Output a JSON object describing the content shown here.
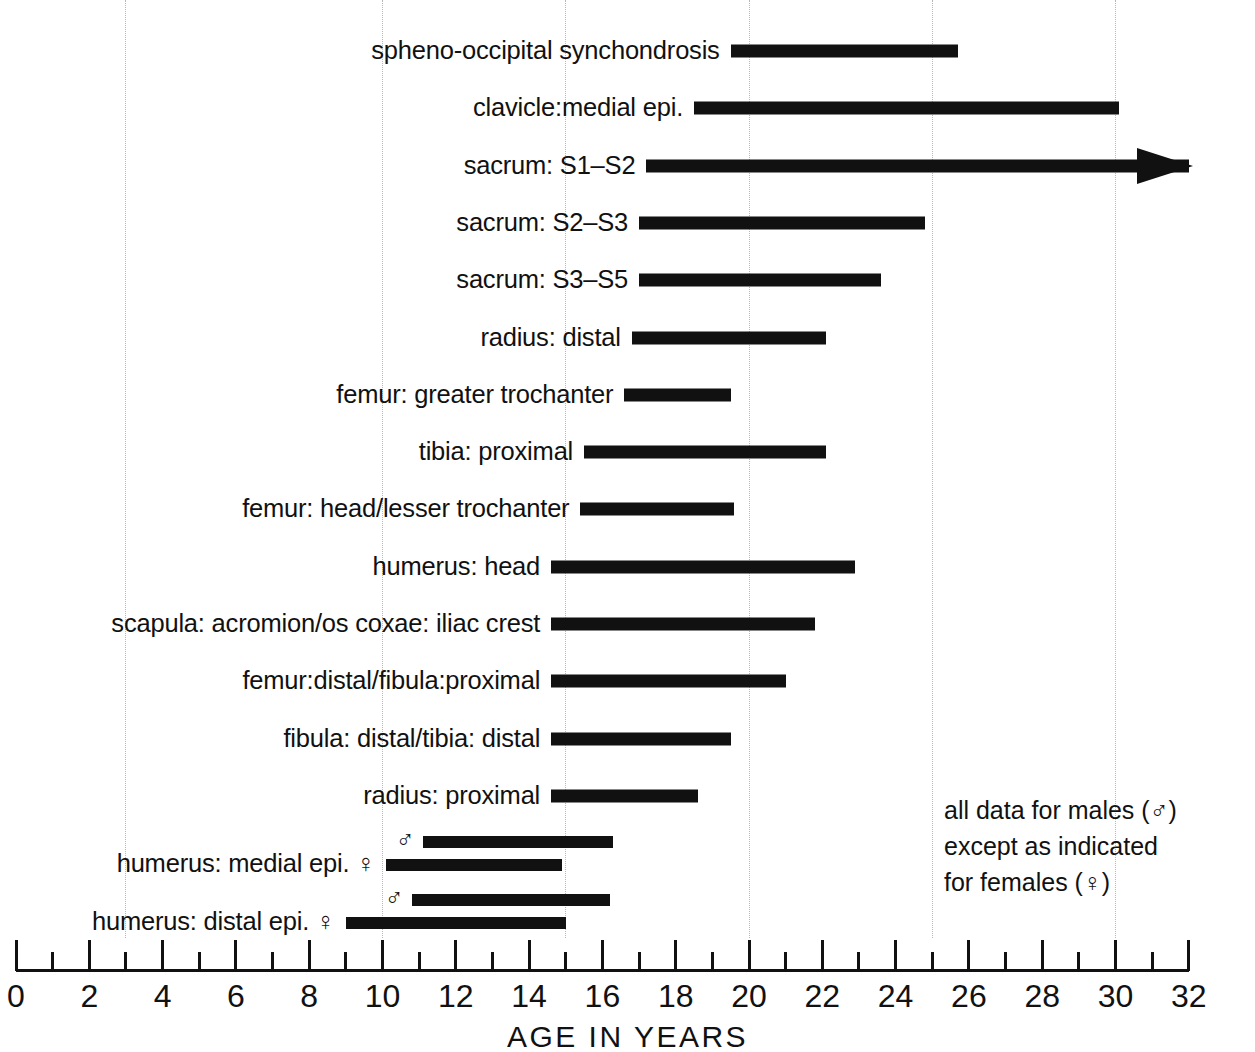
{
  "chart_data": {
    "type": "bar",
    "subtype": "horizontal-range-bars",
    "title": "",
    "xlabel": "AGE IN YEARS",
    "ylabel": "",
    "xlim": [
      0,
      32
    ],
    "xticks": [
      0,
      2,
      4,
      6,
      8,
      10,
      12,
      14,
      16,
      18,
      20,
      22,
      24,
      26,
      28,
      30,
      32
    ],
    "xtick_labels": [
      "0",
      "2",
      "4",
      "6",
      "8",
      "10",
      "12",
      "14",
      "16",
      "18",
      "20",
      "22",
      "24",
      "26",
      "28",
      "30",
      "32"
    ],
    "minor_tick_interval": 1,
    "gridlines": [
      3,
      10,
      15,
      20,
      25,
      30
    ],
    "grid": true,
    "legend": null,
    "bar_color": "#111111",
    "annotation_lines": [
      "all data for males (♂)",
      "except as indicated",
      "for females (♀)"
    ],
    "categories": [
      "spheno-occipital synchondrosis",
      "clavicle:medial epi.",
      "sacrum: S1–S2",
      "sacrum: S2–S3",
      "sacrum: S3–S5",
      "radius: distal",
      "femur: greater trochanter",
      "tibia: proximal",
      "femur: head/lesser trochanter",
      "humerus: head",
      "scapula: acromion/os coxae: iliac crest",
      "femur:distal/fibula:proximal",
      "fibula: distal/tibia: distal",
      "radius: proximal",
      "humerus: medial epi.",
      "humerus: distal epi."
    ],
    "rows": [
      {
        "label": "spheno-occipital synchondrosis",
        "bars": [
          {
            "sex": "male",
            "start": 19.5,
            "end": 25.7,
            "open_ended": false
          }
        ]
      },
      {
        "label": "clavicle:medial epi.",
        "bars": [
          {
            "sex": "male",
            "start": 18.5,
            "end": 30.1,
            "open_ended": false
          }
        ]
      },
      {
        "label": "sacrum: S1–S2",
        "bars": [
          {
            "sex": "male",
            "start": 17.2,
            "end": 32.0,
            "open_ended": true
          }
        ]
      },
      {
        "label": "sacrum: S2–S3",
        "bars": [
          {
            "sex": "male",
            "start": 17.0,
            "end": 24.8,
            "open_ended": false
          }
        ]
      },
      {
        "label": "sacrum: S3–S5",
        "bars": [
          {
            "sex": "male",
            "start": 17.0,
            "end": 23.6,
            "open_ended": false
          }
        ]
      },
      {
        "label": "radius: distal",
        "bars": [
          {
            "sex": "male",
            "start": 16.8,
            "end": 22.1,
            "open_ended": false
          }
        ]
      },
      {
        "label": "femur: greater trochanter",
        "bars": [
          {
            "sex": "male",
            "start": 16.6,
            "end": 19.5,
            "open_ended": false
          }
        ]
      },
      {
        "label": "tibia: proximal",
        "bars": [
          {
            "sex": "male",
            "start": 15.5,
            "end": 22.1,
            "open_ended": false
          }
        ]
      },
      {
        "label": "femur: head/lesser trochanter",
        "bars": [
          {
            "sex": "male",
            "start": 15.4,
            "end": 19.6,
            "open_ended": false
          }
        ]
      },
      {
        "label": "humerus: head",
        "bars": [
          {
            "sex": "male",
            "start": 14.6,
            "end": 22.9,
            "open_ended": false
          }
        ]
      },
      {
        "label": "scapula: acromion/os coxae: iliac crest",
        "bars": [
          {
            "sex": "male",
            "start": 14.6,
            "end": 21.8,
            "open_ended": false
          }
        ]
      },
      {
        "label": "femur:distal/fibula:proximal",
        "bars": [
          {
            "sex": "male",
            "start": 14.6,
            "end": 21.0,
            "open_ended": false
          }
        ]
      },
      {
        "label": "fibula: distal/tibia: distal",
        "bars": [
          {
            "sex": "male",
            "start": 14.6,
            "end": 19.5,
            "open_ended": false
          }
        ]
      },
      {
        "label": "radius: proximal",
        "bars": [
          {
            "sex": "male",
            "start": 14.6,
            "end": 18.6,
            "open_ended": false
          }
        ]
      },
      {
        "label": "humerus: medial epi.",
        "bars": [
          {
            "sex": "male",
            "start": 11.1,
            "end": 16.3,
            "open_ended": false
          },
          {
            "sex": "female",
            "start": 10.1,
            "end": 14.9,
            "open_ended": false
          }
        ]
      },
      {
        "label": "humerus: distal epi.",
        "bars": [
          {
            "sex": "male",
            "start": 10.8,
            "end": 16.2,
            "open_ended": false
          },
          {
            "sex": "female",
            "start": 9.0,
            "end": 15.0,
            "open_ended": false
          }
        ]
      }
    ]
  },
  "symbols": {
    "male": "♂",
    "female": "♀"
  },
  "axis": {
    "title": "AGE IN YEARS"
  },
  "annotation": {
    "line1": "all data for males (♂)",
    "line2": "except as indicated",
    "line3": "for females (♀)"
  }
}
